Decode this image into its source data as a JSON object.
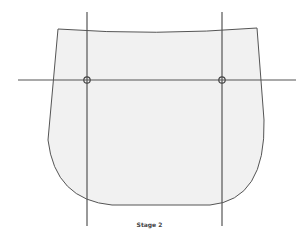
{
  "diagram": {
    "caption": "Stage 2",
    "colors": {
      "background": "#ffffff",
      "shape_fill": "#f1f1f1",
      "stroke": "#555555"
    },
    "shape": {
      "type": "pattern-piece outline",
      "top_left": [
        58,
        29
      ],
      "top_right": [
        257,
        28
      ],
      "bottom_y": 205
    },
    "guide_lines": {
      "horizontal": {
        "y": 80,
        "x_start": 18,
        "x_end": 296
      },
      "vertical_left": {
        "x": 87,
        "y_start": 12,
        "y_end": 226
      },
      "vertical_right": {
        "x": 222,
        "y_start": 12,
        "y_end": 226
      }
    },
    "markers": [
      {
        "name": "left-intersection",
        "x": 87,
        "y": 80
      },
      {
        "name": "right-intersection",
        "x": 222,
        "y": 80
      }
    ]
  }
}
